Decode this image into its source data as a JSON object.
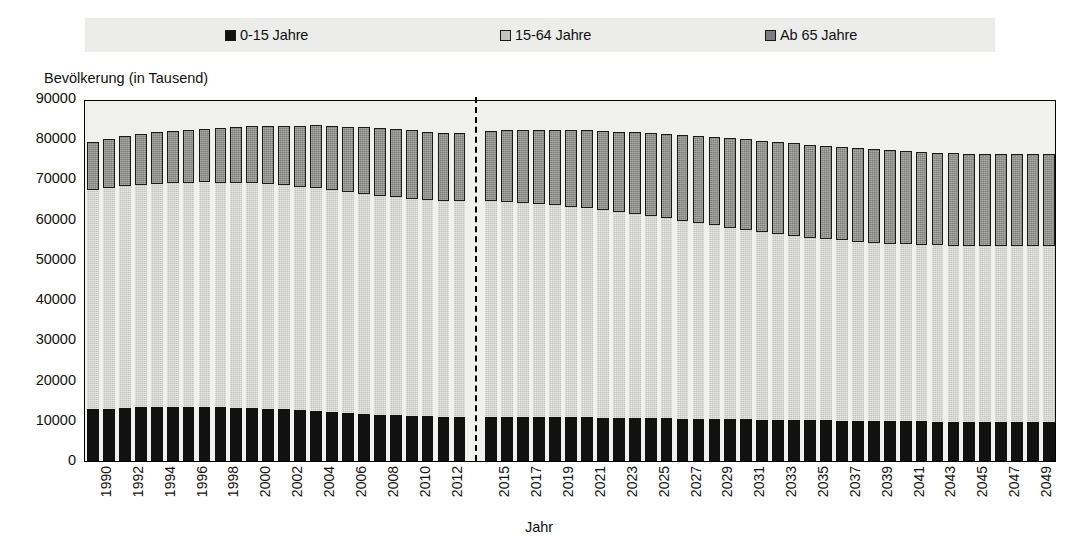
{
  "legend": {
    "items": [
      {
        "label": "0-15 Jahre",
        "color": "#111111",
        "icon": "square-swatch-icon"
      },
      {
        "label": "15-64 Jahre",
        "color": "#c3c3c1",
        "icon": "square-swatch-icon"
      },
      {
        "label": "Ab 65 Jahre",
        "color": "#7e7e7c",
        "icon": "square-swatch-icon"
      }
    ],
    "background": "#ececeb"
  },
  "axis": {
    "ylabel": "Bevölkerung (in Tausend)",
    "xlabel": "Jahr",
    "yticks": [
      0,
      10000,
      20000,
      30000,
      40000,
      50000,
      60000,
      70000,
      80000,
      90000
    ]
  },
  "chart_data": {
    "type": "bar",
    "title": "",
    "subtitle": "",
    "xlabel": "Jahr",
    "ylabel": "Bevölkerung (in Tausend)",
    "ylim": [
      0,
      90000
    ],
    "grid": false,
    "stacked": true,
    "legend_position": "top",
    "annotations": [
      {
        "type": "vline",
        "after_category": "2013",
        "style": "dashed",
        "color": "#000000",
        "note": "Trennung Ist-Daten / Vorausberechnung"
      }
    ],
    "gap_after": "2013",
    "categories": [
      "1990",
      "1991",
      "1992",
      "1993",
      "1994",
      "1995",
      "1996",
      "1997",
      "1998",
      "1999",
      "2000",
      "2001",
      "2002",
      "2003",
      "2004",
      "2005",
      "2006",
      "2007",
      "2008",
      "2009",
      "2010",
      "2011",
      "2012",
      "2013",
      "2015",
      "2016",
      "2017",
      "2018",
      "2019",
      "2020",
      "2021",
      "2022",
      "2023",
      "2024",
      "2025",
      "2026",
      "2027",
      "2028",
      "2029",
      "2030",
      "2031",
      "2032",
      "2033",
      "2034",
      "2035",
      "2036",
      "2037",
      "2038",
      "2039",
      "2040",
      "2041",
      "2042",
      "2043",
      "2044",
      "2045",
      "2046",
      "2047",
      "2048",
      "2049",
      "2050"
    ],
    "tick_labels_shown": [
      "1990",
      "1992",
      "1994",
      "1996",
      "1998",
      "2000",
      "2002",
      "2004",
      "2006",
      "2008",
      "2010",
      "2012",
      "2015",
      "2017",
      "2019",
      "2021",
      "2023",
      "2025",
      "2027",
      "2029",
      "2031",
      "2033",
      "2035",
      "2037",
      "2039",
      "2041",
      "2043",
      "2045",
      "2047",
      "2049"
    ],
    "series": [
      {
        "name": "0-15 Jahre",
        "color": "#111111",
        "values": [
          12900,
          13050,
          13200,
          13350,
          13450,
          13500,
          13500,
          13450,
          13350,
          13250,
          13150,
          13000,
          12850,
          12650,
          12450,
          12200,
          11950,
          11750,
          11550,
          11400,
          11250,
          11150,
          11050,
          11000,
          10950,
          10950,
          10950,
          10950,
          10900,
          10880,
          10850,
          10800,
          10750,
          10700,
          10650,
          10600,
          10550,
          10500,
          10450,
          10400,
          10350,
          10300,
          10250,
          10200,
          10150,
          10100,
          10050,
          10000,
          9950,
          9900,
          9880,
          9850,
          9820,
          9800,
          9780,
          9750,
          9730,
          9700,
          9680,
          9650
        ]
      },
      {
        "name": "15-64 Jahre",
        "color": "#c3c3c1",
        "values": [
          54600,
          54900,
          55200,
          55350,
          55500,
          55600,
          55700,
          55800,
          55850,
          55900,
          55850,
          55800,
          55700,
          55550,
          55400,
          55150,
          54900,
          54700,
          54450,
          54200,
          54000,
          53800,
          53650,
          53550,
          53700,
          53500,
          53300,
          53000,
          52700,
          52350,
          52000,
          51600,
          51200,
          50700,
          50200,
          49700,
          49200,
          48700,
          48150,
          47600,
          47050,
          46550,
          46100,
          45700,
          45350,
          45050,
          44800,
          44550,
          44350,
          44150,
          44000,
          43900,
          43800,
          43750,
          43700,
          43700,
          43700,
          43750,
          43800,
          43900
        ]
      },
      {
        "name": "Ab 65 Jahre",
        "color": "#7e7e7c",
        "values": [
          11900,
          12200,
          12400,
          12600,
          12800,
          13000,
          13200,
          13400,
          13650,
          13900,
          14200,
          14500,
          14850,
          15200,
          15600,
          15950,
          16300,
          16550,
          16750,
          16900,
          16950,
          16900,
          16900,
          16950,
          17500,
          17850,
          18150,
          18450,
          18750,
          19050,
          19350,
          19650,
          19950,
          20300,
          20650,
          21000,
          21350,
          21700,
          22050,
          22350,
          22600,
          22800,
          22950,
          23050,
          23150,
          23200,
          23250,
          23250,
          23250,
          23200,
          23150,
          23100,
          23050,
          23000,
          22950,
          22900,
          22850,
          22800,
          22750,
          22700
        ]
      }
    ]
  }
}
